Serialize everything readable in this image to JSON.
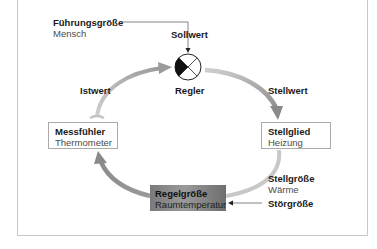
{
  "diagram": {
    "type": "control-loop",
    "input": {
      "title": "Führungsgröße",
      "subtitle": "Mensch"
    },
    "setpoint_label": "Sollwert",
    "controller_label": "Regler",
    "actual_value_label": "Istwert",
    "control_value_label": "Stellwert",
    "sensor": {
      "title": "Messfühler",
      "subtitle": "Thermometer"
    },
    "actuator": {
      "title": "Stellglied",
      "subtitle": "Heizung"
    },
    "manipulated_variable": {
      "title": "Stellgröße",
      "subtitle": "Wärme"
    },
    "disturbance_label": "Störgröße",
    "controlled_variable": {
      "title": "Regelgröße",
      "subtitle": "Raumtemperatur"
    },
    "colors": {
      "arrow_gray": "#9a9a9a",
      "arrow_light": "#c4c4c4",
      "box_border": "#aaaaaa",
      "dark_box": "#8a8a8a"
    }
  }
}
